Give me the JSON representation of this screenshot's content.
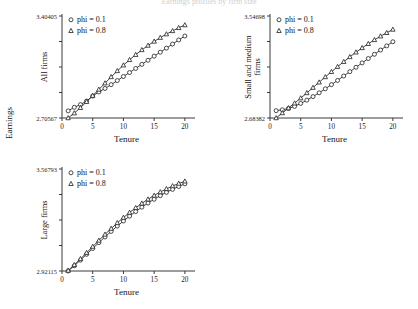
{
  "figure": {
    "title": "Earnings profiles by firm size",
    "global_ylabel": "Earnings",
    "background_color": "#ffffff",
    "line_color": "#2b2b2b"
  },
  "chart_data": [
    {
      "type": "line",
      "panel_id": "all-firms",
      "title": "",
      "ylabel": "All firms",
      "xlabel": "Tenure",
      "xlim": [
        0,
        21
      ],
      "xticks": [
        0,
        5,
        10,
        15,
        20
      ],
      "xticklabels": [
        "0",
        "5",
        "10",
        "15",
        "20"
      ],
      "ylim": [
        2.70567,
        3.40405
      ],
      "ytick_min_label": "2.70567",
      "ytick_max_label": "3.40405",
      "grid": false,
      "legend_position": "top-left",
      "x": [
        1,
        2,
        3,
        4,
        5,
        6,
        7,
        8,
        9,
        10,
        11,
        12,
        13,
        14,
        15,
        16,
        17,
        18,
        19,
        20
      ],
      "series": [
        {
          "name": "phi = 0.1",
          "marker": "circle",
          "values": [
            2.7545,
            2.7788,
            2.7975,
            2.8215,
            2.856,
            2.884,
            2.908,
            2.934,
            2.962,
            2.99,
            3.017,
            3.045,
            3.073,
            3.101,
            3.129,
            3.156,
            3.184,
            3.212,
            3.24,
            3.267
          ]
        },
        {
          "name": "phi = 0.8",
          "marker": "triangle",
          "values": [
            2.7057,
            2.739,
            2.776,
            2.817,
            2.859,
            2.901,
            2.944,
            2.987,
            3.028,
            3.067,
            3.104,
            3.139,
            3.172,
            3.202,
            3.23,
            3.256,
            3.28,
            3.302,
            3.323,
            3.342
          ]
        }
      ]
    },
    {
      "type": "line",
      "panel_id": "small-medium-firms",
      "title": "",
      "ylabel": "Small and medium firms",
      "xlabel": "Tenure",
      "xlim": [
        0,
        21
      ],
      "xticks": [
        0,
        5,
        10,
        15,
        20
      ],
      "xticklabels": [
        "0",
        "5",
        "10",
        "15",
        "20"
      ],
      "ylim": [
        2.68382,
        3.54698
      ],
      "ytick_min_label": "2.68382",
      "ytick_max_label": "3.54698",
      "grid": false,
      "legend_position": "top-left",
      "x": [
        1,
        2,
        3,
        4,
        5,
        6,
        7,
        8,
        9,
        10,
        11,
        12,
        13,
        14,
        15,
        16,
        17,
        18,
        19,
        20
      ],
      "series": [
        {
          "name": "phi = 0.1",
          "marker": "circle",
          "values": [
            2.746,
            2.753,
            2.764,
            2.782,
            2.807,
            2.835,
            2.865,
            2.897,
            2.931,
            2.966,
            3.002,
            3.039,
            3.076,
            3.113,
            3.15,
            3.187,
            3.223,
            3.259,
            3.294,
            3.329
          ]
        },
        {
          "name": "phi = 0.8",
          "marker": "triangle",
          "values": [
            2.6838,
            2.726,
            2.768,
            2.809,
            2.852,
            2.896,
            2.941,
            2.986,
            3.031,
            3.075,
            3.118,
            3.16,
            3.201,
            3.24,
            3.277,
            3.312,
            3.345,
            3.376,
            3.405,
            3.433
          ]
        }
      ]
    },
    {
      "type": "line",
      "panel_id": "large-firms",
      "title": "",
      "ylabel": "Large firms",
      "xlabel": "Tenure",
      "xlim": [
        0,
        21
      ],
      "xticks": [
        0,
        5,
        10,
        15,
        20
      ],
      "xticklabels": [
        "0",
        "5",
        "10",
        "15",
        "20"
      ],
      "ylim": [
        2.92115,
        3.56793
      ],
      "ytick_min_label": "2.92115",
      "ytick_max_label": "3.56793",
      "grid": false,
      "legend_position": "top-left",
      "x": [
        1,
        2,
        3,
        4,
        5,
        6,
        7,
        8,
        9,
        10,
        11,
        12,
        13,
        14,
        15,
        16,
        17,
        18,
        19,
        20
      ],
      "series": [
        {
          "name": "phi = 0.1",
          "marker": "circle",
          "values": [
            2.9212,
            2.954,
            2.99,
            3.027,
            3.064,
            3.101,
            3.137,
            3.172,
            3.206,
            3.238,
            3.269,
            3.298,
            3.326,
            3.352,
            3.376,
            3.399,
            3.42,
            3.439,
            3.457,
            3.474
          ]
        },
        {
          "name": "phi = 0.8",
          "marker": "triangle",
          "values": [
            2.924,
            2.96,
            2.998,
            3.037,
            3.076,
            3.115,
            3.153,
            3.19,
            3.226,
            3.26,
            3.292,
            3.322,
            3.35,
            3.376,
            3.4,
            3.422,
            3.442,
            3.46,
            3.476,
            3.49
          ]
        }
      ]
    }
  ],
  "legend": {
    "entries": [
      {
        "label": "phi = 0.1",
        "marker": "circle"
      },
      {
        "label": "phi = 0.8",
        "marker": "triangle"
      }
    ]
  }
}
